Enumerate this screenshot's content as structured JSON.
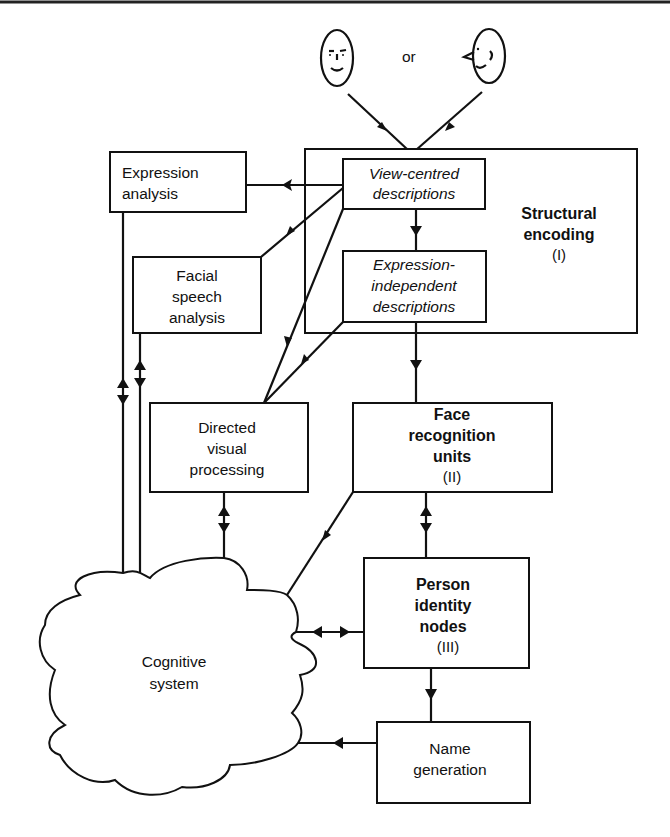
{
  "diagram": {
    "type": "flow-diagram",
    "inputs": {
      "frontal_face_icon": "frontal-face",
      "or_label": "or",
      "profile_face_icon": "profile-face"
    },
    "structural_encoding": {
      "title_line1": "Structural",
      "title_line2": "encoding",
      "numeral": "(I)",
      "view_centred": {
        "line1": "View-centred",
        "line2": "descriptions"
      },
      "expression_independent": {
        "line1": "Expression-",
        "line2": "independent",
        "line3": "descriptions"
      }
    },
    "expression_analysis": {
      "line1": "Expression",
      "line2": "analysis"
    },
    "facial_speech_analysis": {
      "line1": "Facial",
      "line2": "speech",
      "line3": "analysis"
    },
    "directed_visual_processing": {
      "line1": "Directed",
      "line2": "visual",
      "line3": "processing"
    },
    "face_recognition_units": {
      "line1": "Face",
      "line2": "recognition",
      "line3": "units",
      "numeral": "(II)"
    },
    "person_identity_nodes": {
      "line1": "Person",
      "line2": "identity",
      "line3": "nodes",
      "numeral": "(III)"
    },
    "name_generation": {
      "line1": "Name",
      "line2": "generation"
    },
    "cognitive_system": {
      "line1": "Cognitive",
      "line2": "system"
    },
    "connections": [
      {
        "from": "faces",
        "to": "View-centred descriptions",
        "direction": "one-way"
      },
      {
        "from": "View-centred descriptions",
        "to": "Expression analysis",
        "direction": "one-way"
      },
      {
        "from": "View-centred descriptions",
        "to": "Facial speech analysis",
        "direction": "one-way"
      },
      {
        "from": "View-centred descriptions",
        "to": "Directed visual processing",
        "direction": "one-way"
      },
      {
        "from": "View-centred descriptions",
        "to": "Expression-independent descriptions",
        "direction": "one-way"
      },
      {
        "from": "Expression-independent descriptions",
        "to": "Directed visual processing",
        "direction": "one-way"
      },
      {
        "from": "Expression-independent descriptions",
        "to": "Face recognition units",
        "direction": "one-way"
      },
      {
        "from": "Expression analysis",
        "to": "Cognitive system",
        "direction": "two-way"
      },
      {
        "from": "Facial speech analysis",
        "to": "Cognitive system",
        "direction": "two-way"
      },
      {
        "from": "Directed visual processing",
        "to": "Cognitive system",
        "direction": "two-way"
      },
      {
        "from": "Face recognition units",
        "to": "Cognitive system",
        "direction": "one-way"
      },
      {
        "from": "Face recognition units",
        "to": "Person identity nodes",
        "direction": "two-way"
      },
      {
        "from": "Person identity nodes",
        "to": "Cognitive system",
        "direction": "two-way"
      },
      {
        "from": "Person identity nodes",
        "to": "Name generation",
        "direction": "one-way"
      },
      {
        "from": "Name generation",
        "to": "Cognitive system",
        "direction": "one-way"
      }
    ],
    "colors": {
      "ink": "#111111",
      "background": "#ffffff"
    }
  }
}
